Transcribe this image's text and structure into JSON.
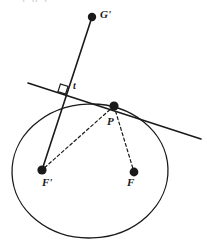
{
  "figure": {
    "kind": "geometry-diagram",
    "background_color": "#ffffff",
    "stroke_color": "#1a1a1a",
    "width": 207,
    "height": 243,
    "cut_off_header_text": "j    p    j"
  },
  "labels": {
    "g_prime": "G'",
    "t": "t",
    "p": "P",
    "f_prime": "F'",
    "f": "F"
  },
  "chart_data": {
    "type": "scatter",
    "title": "",
    "xlabel": "",
    "ylabel": "",
    "grid": false,
    "legend": null,
    "coordinate_space": "pixels, origin top-left, 207x243",
    "points": [
      {
        "name": "G'",
        "label": "G'",
        "x": 92,
        "y": 17,
        "marker": "filled-circle",
        "radius": 4.2
      },
      {
        "name": "P",
        "label": "P",
        "x": 114,
        "y": 106,
        "marker": "filled-circle",
        "radius": 4.6
      },
      {
        "name": "F'",
        "label": "F'",
        "x": 42,
        "y": 170,
        "marker": "filled-circle",
        "radius": 4.6
      },
      {
        "name": "F",
        "label": "F",
        "x": 134,
        "y": 172,
        "marker": "filled-circle",
        "radius": 4.4
      }
    ],
    "ellipse": {
      "center_x": 90,
      "center_y": 171,
      "radius_x": 78,
      "radius_y": 67,
      "rotation_deg": -2,
      "stroke_width": 1.3,
      "fill": "none"
    },
    "segments": [
      {
        "name": "tangent-line-t",
        "style": "solid",
        "stroke_width": 1.6,
        "x1": 28,
        "y1": 83,
        "x2": 201,
        "y2": 139
      },
      {
        "name": "line-F-prime-to-G-prime",
        "style": "solid",
        "stroke_width": 1.6,
        "x1": 42,
        "y1": 170,
        "x2": 92,
        "y2": 17
      },
      {
        "name": "dashed-P-to-F-prime",
        "style": "dashed",
        "stroke_width": 1.2,
        "dash": "3 2.6",
        "x1": 114,
        "y1": 106,
        "x2": 42,
        "y2": 170
      },
      {
        "name": "dashed-P-to-F",
        "style": "dashed",
        "stroke_width": 1.2,
        "dash": "3 2.6",
        "x1": 114,
        "y1": 106,
        "x2": 134,
        "y2": 172
      }
    ],
    "markers": [
      {
        "name": "right-angle-marker",
        "kind": "square",
        "center_x": 63,
        "center_y": 89,
        "size": 8,
        "rotation_deg": 18,
        "stroke_width": 1.2,
        "fill": "none"
      }
    ]
  }
}
